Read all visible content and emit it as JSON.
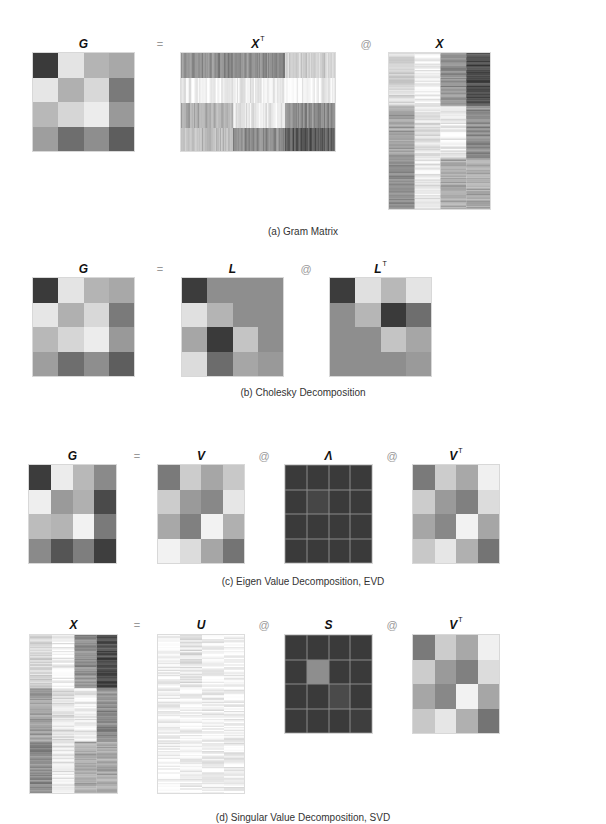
{
  "sections": [
    {
      "id": "a",
      "caption": "(a) Gram Matrix",
      "caption_y": 226,
      "title_y": 37,
      "items": [
        {
          "type": "matrix",
          "name": "G",
          "sup": "",
          "x": 32,
          "y": 52,
          "w": 103,
          "h": 100,
          "kind": "grid",
          "cells": [
            [
              "#3a3a3a",
              "#e4e4e4",
              "#b4b4b4",
              "#a8a8a8"
            ],
            [
              "#e6e6e6",
              "#b0b0b0",
              "#d8d8d8",
              "#7a7a7a"
            ],
            [
              "#b8b8b8",
              "#d6d6d6",
              "#ececec",
              "#999999"
            ],
            [
              "#9e9e9e",
              "#6e6e6e",
              "#8e8e8e",
              "#5e5e5e"
            ]
          ]
        },
        {
          "type": "op",
          "symbol": "=",
          "x": 160
        },
        {
          "type": "matrix",
          "name": "X",
          "sup": "T",
          "x": 180,
          "y": 52,
          "w": 156,
          "h": 100,
          "kind": "hstripes",
          "bands": [
            [
              "#8a8a8a",
              "#8a8a8a",
              "#d0d0d0"
            ],
            [
              "#ececec",
              "#e8e8e8",
              "#f0f0f0"
            ],
            [
              "#a8a8a8",
              "#e6e6e6",
              "#8c8c8c"
            ],
            [
              "#bcbcbc",
              "#8a8a8a",
              "#555555"
            ]
          ]
        },
        {
          "type": "op",
          "symbol": "@",
          "x": 366
        },
        {
          "type": "matrix",
          "name": "X",
          "sup": "",
          "x": 388,
          "y": 52,
          "w": 103,
          "h": 158,
          "kind": "vstripes",
          "bands": [
            [
              "#d4d4d4",
              "#a0a0a0",
              "#8a8a8a"
            ],
            [
              "#f0f0f0",
              "#e0e0e0",
              "#e8e8e8"
            ],
            [
              "#8e8e8e",
              "#ececec",
              "#a8a8a8"
            ],
            [
              "#4a4a4a",
              "#8a8a8a",
              "#a8a8a8"
            ]
          ]
        }
      ]
    },
    {
      "id": "b",
      "caption": "(b) Cholesky Decomposition",
      "caption_y": 387,
      "title_y": 262,
      "items": [
        {
          "type": "matrix",
          "name": "G",
          "sup": "",
          "x": 32,
          "y": 277,
          "w": 103,
          "h": 100,
          "kind": "grid",
          "cells": [
            [
              "#3a3a3a",
              "#e4e4e4",
              "#b4b4b4",
              "#a8a8a8"
            ],
            [
              "#e6e6e6",
              "#b0b0b0",
              "#d8d8d8",
              "#7a7a7a"
            ],
            [
              "#b8b8b8",
              "#d6d6d6",
              "#ececec",
              "#999999"
            ],
            [
              "#9e9e9e",
              "#6e6e6e",
              "#8e8e8e",
              "#5e5e5e"
            ]
          ]
        },
        {
          "type": "op",
          "symbol": "=",
          "x": 160
        },
        {
          "type": "matrix",
          "name": "L",
          "sup": "",
          "x": 181,
          "y": 277,
          "w": 103,
          "h": 100,
          "kind": "grid",
          "cells": [
            [
              "#3c3c3c",
              "#8e8e8e",
              "#8e8e8e",
              "#8e8e8e"
            ],
            [
              "#e0e0e0",
              "#b4b4b4",
              "#8e8e8e",
              "#8e8e8e"
            ],
            [
              "#a6a6a6",
              "#3a3a3a",
              "#c4c4c4",
              "#8e8e8e"
            ],
            [
              "#dcdcdc",
              "#6c6c6c",
              "#a6a6a6",
              "#999999"
            ]
          ]
        },
        {
          "type": "op",
          "symbol": "@",
          "x": 306
        },
        {
          "type": "matrix",
          "name": "L",
          "sup": "T",
          "x": 329,
          "y": 277,
          "w": 103,
          "h": 100,
          "kind": "grid",
          "cells": [
            [
              "#3c3c3c",
              "#e0e0e0",
              "#b8b8b8",
              "#e4e4e4"
            ],
            [
              "#8e8e8e",
              "#b6b6b6",
              "#3a3a3a",
              "#6e6e6e"
            ],
            [
              "#8e8e8e",
              "#8e8e8e",
              "#c4c4c4",
              "#a6a6a6"
            ],
            [
              "#8e8e8e",
              "#8e8e8e",
              "#8e8e8e",
              "#9a9a9a"
            ]
          ]
        }
      ]
    },
    {
      "id": "c",
      "caption": "(c) Eigen Value Decomposition, EVD",
      "caption_y": 576,
      "title_y": 449,
      "items": [
        {
          "type": "matrix",
          "name": "G",
          "sup": "",
          "x": 28,
          "y": 464,
          "w": 89,
          "h": 100,
          "kind": "grid",
          "cells": [
            [
              "#3c3c3c",
              "#ececec",
              "#b8b8b8",
              "#8a8a8a"
            ],
            [
              "#eeeeee",
              "#9a9a9a",
              "#b0b0b0",
              "#4a4a4a"
            ],
            [
              "#bcbcbc",
              "#b4b4b4",
              "#f2f2f2",
              "#7a7a7a"
            ],
            [
              "#8a8a8a",
              "#555555",
              "#7e7e7e",
              "#3e3e3e"
            ]
          ]
        },
        {
          "type": "op",
          "symbol": "=",
          "x": 137
        },
        {
          "type": "matrix",
          "name": "V",
          "sup": "",
          "x": 157,
          "y": 464,
          "w": 88,
          "h": 100,
          "kind": "grid",
          "cells": [
            [
              "#7a7a7a",
              "#cccccc",
              "#a6a6a6",
              "#c8c8c8"
            ],
            [
              "#cccccc",
              "#9a9a9a",
              "#888888",
              "#e6e6e6"
            ],
            [
              "#a8a8a8",
              "#808080",
              "#f2f2f2",
              "#b0b0b0"
            ],
            [
              "#f2f2f2",
              "#dcdcdc",
              "#a6a6a6",
              "#747474"
            ]
          ]
        },
        {
          "type": "op",
          "symbol": "@",
          "x": 264
        },
        {
          "type": "matrix",
          "name": "Λ",
          "sup": "",
          "x": 284,
          "y": 464,
          "w": 89,
          "h": 100,
          "kind": "grid",
          "lined": true,
          "cells": [
            [
              "#3a3a3a",
              "#3a3a3a",
              "#3a3a3a",
              "#3a3a3a"
            ],
            [
              "#3a3a3a",
              "#464646",
              "#3a3a3a",
              "#3a3a3a"
            ],
            [
              "#3a3a3a",
              "#3a3a3a",
              "#3a3a3a",
              "#3a3a3a"
            ],
            [
              "#3a3a3a",
              "#3a3a3a",
              "#3a3a3a",
              "#3a3a3a"
            ]
          ]
        },
        {
          "type": "op",
          "symbol": "@",
          "x": 392
        },
        {
          "type": "matrix",
          "name": "V",
          "sup": "T",
          "x": 412,
          "y": 464,
          "w": 88,
          "h": 100,
          "kind": "grid",
          "cells": [
            [
              "#7a7a7a",
              "#cccccc",
              "#a8a8a8",
              "#f0f0f0"
            ],
            [
              "#cccccc",
              "#9a9a9a",
              "#808080",
              "#dcdcdc"
            ],
            [
              "#a6a6a6",
              "#888888",
              "#f2f2f2",
              "#a6a6a6"
            ],
            [
              "#c8c8c8",
              "#e6e6e6",
              "#b0b0b0",
              "#747474"
            ]
          ]
        }
      ]
    },
    {
      "id": "d",
      "caption": "(d) Singular Value Decomposition, SVD",
      "caption_y": 812,
      "title_y": 618,
      "items": [
        {
          "type": "matrix",
          "name": "X",
          "sup": "",
          "x": 29,
          "y": 634,
          "w": 89,
          "h": 160,
          "kind": "vstripes",
          "bands": [
            [
              "#d4d4d4",
              "#a0a0a0",
              "#8a8a8a"
            ],
            [
              "#f0f0f0",
              "#e0e0e0",
              "#e8e8e8"
            ],
            [
              "#8e8e8e",
              "#ececec",
              "#a8a8a8"
            ],
            [
              "#4a4a4a",
              "#8a8a8a",
              "#a8a8a8"
            ]
          ]
        },
        {
          "type": "op",
          "symbol": "=",
          "x": 137
        },
        {
          "type": "matrix",
          "name": "U",
          "sup": "",
          "x": 157,
          "y": 634,
          "w": 88,
          "h": 160,
          "kind": "vstripes",
          "bands": [
            [
              "#f2f2f2",
              "#f4f4f4",
              "#f4f4f4"
            ],
            [
              "#e4e4e4",
              "#f4f4f4",
              "#f4f4f4"
            ],
            [
              "#f2f2f2",
              "#eeeeee",
              "#f2f2f2"
            ],
            [
              "#f4f4f4",
              "#f2f2f2",
              "#ececec"
            ]
          ]
        },
        {
          "type": "op",
          "symbol": "@",
          "x": 264
        },
        {
          "type": "matrix",
          "name": "S",
          "sup": "",
          "x": 284,
          "y": 634,
          "w": 89,
          "h": 100,
          "kind": "grid",
          "lined": true,
          "cells": [
            [
              "#3a3a3a",
              "#3a3a3a",
              "#3a3a3a",
              "#3a3a3a"
            ],
            [
              "#3a3a3a",
              "#8e8e8e",
              "#3a3a3a",
              "#3a3a3a"
            ],
            [
              "#3a3a3a",
              "#3a3a3a",
              "#4a4a4a",
              "#3a3a3a"
            ],
            [
              "#3a3a3a",
              "#3a3a3a",
              "#3a3a3a",
              "#3e3e3e"
            ]
          ]
        },
        {
          "type": "op",
          "symbol": "@",
          "x": 392
        },
        {
          "type": "matrix",
          "name": "V",
          "sup": "T",
          "x": 412,
          "y": 634,
          "w": 88,
          "h": 100,
          "kind": "grid",
          "cells": [
            [
              "#7a7a7a",
              "#cccccc",
              "#a8a8a8",
              "#f0f0f0"
            ],
            [
              "#cccccc",
              "#9a9a9a",
              "#808080",
              "#dcdcdc"
            ],
            [
              "#a6a6a6",
              "#888888",
              "#f2f2f2",
              "#a6a6a6"
            ],
            [
              "#c8c8c8",
              "#e6e6e6",
              "#b0b0b0",
              "#747474"
            ]
          ]
        }
      ]
    }
  ]
}
